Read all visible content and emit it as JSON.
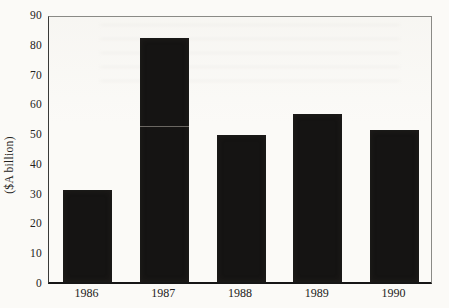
{
  "chart_data": {
    "type": "bar",
    "categories": [
      "1986",
      "1987",
      "1988",
      "1989",
      "1990"
    ],
    "values": [
      31,
      82,
      49.5,
      56.5,
      51
    ],
    "title": "",
    "xlabel": "",
    "ylabel": "($A billion)",
    "ylim": [
      0,
      90
    ],
    "yticks": [
      0,
      10,
      20,
      30,
      40,
      50,
      60,
      70,
      80,
      90
    ],
    "grid": false,
    "legend_position": "none",
    "bar_color": "#151413",
    "axis_color": "#3a3a38",
    "frame_color": "#8a8a86",
    "background_color": "#fbfaf7"
  }
}
